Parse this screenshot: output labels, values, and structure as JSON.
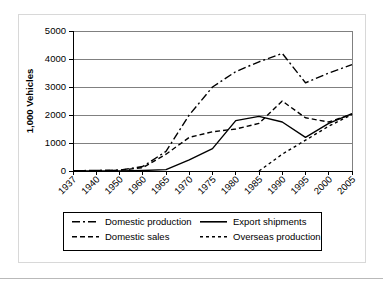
{
  "chart_data": {
    "type": "line",
    "title": "",
    "xlabel": "",
    "ylabel": "1,000 Vehicles",
    "ylim": [
      0,
      5000
    ],
    "yticks": [
      0,
      1000,
      2000,
      3000,
      4000,
      5000
    ],
    "ytick_labels": [
      "0",
      "1000",
      "2000",
      "3000",
      "4000",
      "5000"
    ],
    "grid": true,
    "legend_position": "below",
    "categories": [
      "1937",
      "1940",
      "1950",
      "1960",
      "1965",
      "1970",
      "1975",
      "1980",
      "1985",
      "1990",
      "1995",
      "2000",
      "2005"
    ],
    "series": [
      {
        "name": "Domestic production",
        "style": "dash-dot",
        "values": [
          10,
          20,
          30,
          160,
          700,
          2000,
          3000,
          3550,
          3900,
          4200,
          3150,
          3500,
          3800
        ]
      },
      {
        "name": "Domestic sales",
        "style": "dashed",
        "values": [
          10,
          15,
          25,
          120,
          600,
          1200,
          1400,
          1500,
          1700,
          2500,
          1900,
          1750,
          2030
        ]
      },
      {
        "name": "Export shipments",
        "style": "solid",
        "values": [
          0,
          0,
          0,
          20,
          50,
          400,
          800,
          1800,
          1950,
          1750,
          1200,
          1700,
          2050
        ]
      },
      {
        "name": "Overseas production",
        "style": "dotted-dash",
        "values": [
          null,
          null,
          null,
          null,
          null,
          null,
          null,
          null,
          0,
          600,
          1100,
          1600,
          2020
        ]
      }
    ],
    "annotations": []
  },
  "legend": {
    "entries": [
      {
        "label": "Domestic production",
        "style": "dash-dot"
      },
      {
        "label": "Export shipments",
        "style": "solid"
      },
      {
        "label": "Domestic sales",
        "style": "dashed"
      },
      {
        "label": "Overseas production",
        "style": "dotted-dash"
      }
    ]
  }
}
